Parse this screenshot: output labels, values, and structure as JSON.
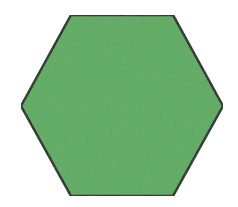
{
  "figure": {
    "width": 238,
    "height": 207,
    "background": "#ffffff",
    "shape": {
      "type": "hexagon",
      "orientation": "flat-top",
      "points": "71,15 173,15 223,106 173,196 71,196 21,106",
      "fill": "#5bab5f",
      "stroke": "#1c2a1c",
      "stroke_width": 2.5
    }
  }
}
